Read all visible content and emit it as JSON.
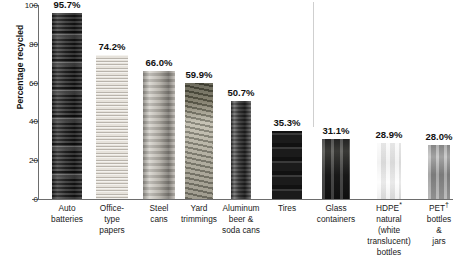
{
  "chart_data": {
    "type": "bar",
    "title": "",
    "xlabel": "",
    "ylabel": "Percentage recycled",
    "ylim": [
      0,
      100
    ],
    "yticks": [
      0,
      20,
      40,
      60,
      80,
      100
    ],
    "ytick_labels": [
      "0",
      "20",
      "40",
      "60",
      "80",
      "100"
    ],
    "grid": false,
    "legend": "none",
    "categories": [
      "Auto\nbatteries",
      "Office-\ntype\npapers",
      "Steel\ncans",
      "Yard\ntrimmings",
      "Aluminum\nbeer &\nsoda cans",
      "Tires",
      "Glass\ncontainers",
      "HDPE*\nnatural\n(white\ntranslucent)\nbottles",
      "PET†\nbottles &\njars"
    ],
    "values": [
      95.7,
      74.2,
      66.0,
      59.9,
      50.7,
      35.3,
      31.1,
      28.9,
      28.0
    ],
    "value_labels": [
      "95.7%",
      "74.2%",
      "66.0%",
      "59.9%",
      "50.7%",
      "35.3%",
      "31.1%",
      "28.9%",
      "28.0%"
    ],
    "annotations": {
      "divider": "vertical separator between material groups"
    }
  },
  "bars": [
    {
      "label": "Auto batteries",
      "value_label": "95.7%",
      "texture": "tex-battery",
      "left": 52,
      "width": 30,
      "name": "bar-auto-batteries"
    },
    {
      "label": "Office-type papers",
      "value_label": "74.2%",
      "texture": "tex-paper",
      "left": 96,
      "width": 32,
      "name": "bar-office-type-papers"
    },
    {
      "label": "Steel cans",
      "value_label": "66.0%",
      "texture": "tex-steel",
      "left": 143,
      "width": 32,
      "name": "bar-steel-cans"
    },
    {
      "label": "Yard trimmings",
      "value_label": "59.9%",
      "texture": "tex-yard",
      "left": 185,
      "width": 28,
      "name": "bar-yard-trimmings"
    },
    {
      "label": "Aluminum beer & soda cans",
      "value_label": "50.7%",
      "texture": "tex-alum",
      "left": 231,
      "width": 20,
      "name": "bar-aluminum-cans"
    },
    {
      "label": "Tires",
      "value_label": "35.3%",
      "texture": "tex-tire",
      "left": 272,
      "width": 30,
      "name": "bar-tires"
    },
    {
      "label": "Glass containers",
      "value_label": "31.1%",
      "texture": "tex-glass",
      "left": 322,
      "width": 28,
      "name": "bar-glass-containers"
    },
    {
      "label": "HDPE natural bottles",
      "value_label": "28.9%",
      "texture": "tex-hdpe",
      "left": 377,
      "width": 24,
      "name": "bar-hdpe-bottles"
    },
    {
      "label": "PET bottles & jars",
      "value_label": "28.0%",
      "texture": "tex-pet",
      "left": 428,
      "width": 22,
      "name": "bar-pet-bottles"
    }
  ],
  "axis": {
    "y_label": "Percentage recycled",
    "y_ticks": [
      "100",
      "80",
      "60",
      "40",
      "20",
      "0"
    ]
  },
  "category_labels": [
    {
      "lines": [
        "Auto",
        "batteries"
      ],
      "center": 67
    },
    {
      "lines": [
        "Office-",
        "type",
        "papers"
      ],
      "center": 112
    },
    {
      "lines": [
        "Steel",
        "cans"
      ],
      "center": 159
    },
    {
      "lines": [
        "Yard",
        "trimmings"
      ],
      "center": 199
    },
    {
      "lines": [
        "Aluminum",
        "beer &",
        "soda cans"
      ],
      "center": 241
    },
    {
      "lines": [
        "Tires"
      ],
      "center": 287
    },
    {
      "lines": [
        "Glass",
        "containers"
      ],
      "center": 336
    },
    {
      "lines": [
        "HDPE*",
        "natural",
        "(white",
        "translucent)",
        "bottles"
      ],
      "center": 389
    },
    {
      "lines": [
        "PET†",
        "bottles &",
        "jars"
      ],
      "center": 439
    }
  ],
  "colors": {
    "axis": "#6d6d6d",
    "divider": "#cfcfcf",
    "text": "#1a1a1a",
    "background": "#ffffff"
  }
}
